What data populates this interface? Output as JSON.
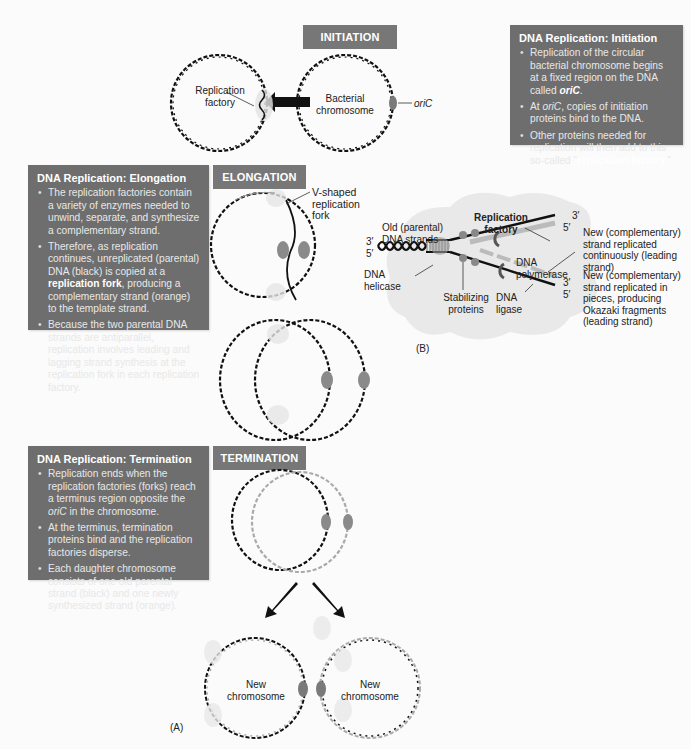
{
  "stages": {
    "initiation": "INITIATION",
    "elongation": "ELONGATION",
    "termination": "TERMINATION"
  },
  "boxes": {
    "initiation": {
      "title": "DNA Replication: Initiation",
      "bullets": [
        {
          "pre": "Replication of the circular bacterial chromosome begins at a fixed region on the DNA called ",
          "bold": "oriC",
          "post": "."
        },
        {
          "pre": "At ",
          "italic": "oriC",
          "post": ", copies of initiation proteins bind to the DNA."
        },
        {
          "pre": "Other proteins needed for replication will then add to this so-called “",
          "bold": "replication factory.",
          "post": "”"
        }
      ]
    },
    "elongation": {
      "title": "DNA Replication: Elongation",
      "bullets": [
        {
          "pre": "The replication factories contain a variety of enzymes needed to unwind, separate, and synthesize a complementary strand."
        },
        {
          "pre": "Therefore, as replication continues, unreplicated (parental) DNA (black) is copied at a ",
          "bold": "replication fork",
          "post": ", producing a complementary strand (orange) to the template strand."
        },
        {
          "pre": "Because the two parental DNA strands are antiparallel, replication involves leading and lagging strand synthesis at the replication fork in each replication factory."
        }
      ]
    },
    "termination": {
      "title": "DNA Replication: Termination",
      "bullets": [
        {
          "pre": "Replication ends when the replication factories (forks) reach a terminus region opposite the ",
          "italic": "oriC",
          "post": " in the chromosome."
        },
        {
          "pre": "At the terminus, termination proteins bind and the replication factories disperse."
        },
        {
          "pre": "Each daughter chromosome consists of one old parental strand (black) and one newly synthesized strand (orange)."
        }
      ]
    }
  },
  "labels": {
    "replication_factory_left": "Replication factory",
    "bacterial_chromosome": "Bacterial chromosome",
    "oric": "oriC",
    "v_fork": "V-shaped replication fork",
    "new_chromosome_1": "New chromosome",
    "new_chromosome_2": "New chromosome",
    "panel_a": "(A)",
    "panel_b": "(B)"
  },
  "fork_diagram": {
    "title": "Replication factory",
    "old_strands": "Old (parental) DNA strands",
    "helicase": "DNA helicase",
    "stabilizing": "Stabilizing proteins",
    "polymerase": "DNA polymerase",
    "ligase": "DNA ligase",
    "leading": "New (complementary) strand replicated continuously (leading strand)",
    "lagging": "New (complementary) strand replicated in pieces, producing Okazaki fragments (leading strand)",
    "ends": {
      "top_3": "3′",
      "top_5": "5′",
      "left_3": "3′",
      "left_5": "5′",
      "bot_3": "3′",
      "bot_5": "5′"
    }
  },
  "colors": {
    "box_bg": "#6e6e6e",
    "stage_bg": "#777777",
    "new_strand": "#a9a9a9",
    "oric_marker": "#7a7a7a",
    "factory_cloud": "#e6e6e6"
  }
}
